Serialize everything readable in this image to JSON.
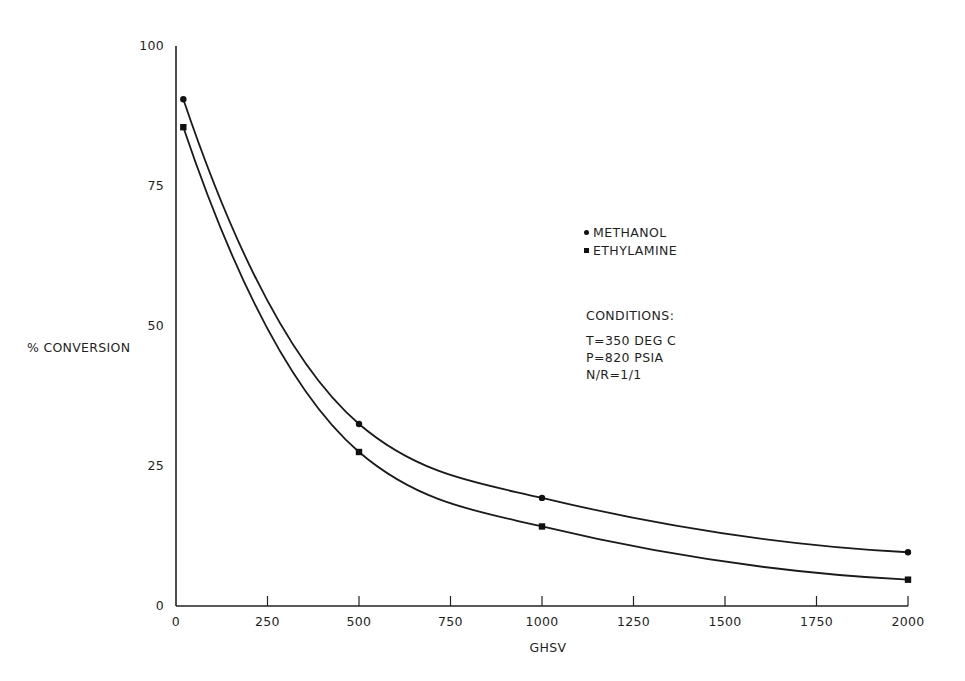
{
  "chart_data": {
    "type": "line",
    "title": "",
    "xlabel": "GHSV",
    "ylabel": "% CONVERSION",
    "xlim": [
      0,
      2000
    ],
    "ylim": [
      0,
      100
    ],
    "grid": false,
    "legend_position": "upper-right (inside, mid-plot)",
    "x_ticks": [
      "0",
      "250",
      "500",
      "750",
      "1000",
      "1250",
      "1500",
      "1750",
      "2000"
    ],
    "y_ticks": [
      "0",
      "25",
      "50",
      "75",
      "100"
    ],
    "series": [
      {
        "name": "METHANOL",
        "marker": "circle",
        "x": [
          20,
          500,
          1000,
          2000
        ],
        "values": [
          90.5,
          32.5,
          19.3,
          9.6
        ],
        "fit_curve": true
      },
      {
        "name": "ETHYLAMINE",
        "marker": "square",
        "x": [
          20,
          500,
          1000,
          2000
        ],
        "values": [
          85.5,
          27.5,
          14.2,
          4.7
        ],
        "fit_curve": true
      }
    ],
    "annotations": {
      "conditions_title": "CONDITIONS:",
      "conditions": [
        "T=350 DEG C",
        "P=820 PSIA",
        "N/R=1/1"
      ]
    }
  },
  "legend": {
    "methanol": "METHANOL",
    "ethylamine": "ETHYLAMINE"
  },
  "conditions": {
    "title": "CONDITIONS:",
    "temperature": "T=350 DEG C",
    "pressure": "P=820 PSIA",
    "ratio": "N/R=1/1"
  },
  "axes": {
    "xlabel": "GHSV",
    "ylabel": "% CONVERSION"
  }
}
